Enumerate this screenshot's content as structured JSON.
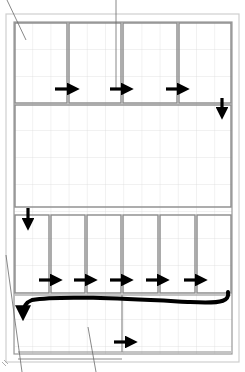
{
  "diagram": {
    "type": "panel-flow-layout",
    "colors": {
      "background": "#ffffff",
      "grid": "#d8d8d8",
      "panel_border": "#8a8a8a",
      "paper_border": "#c8c8c8",
      "arrow": "#000000",
      "annotation_line": "#707070"
    },
    "rows": [
      {
        "id": "top-row",
        "panel_count": 4,
        "arrow_direction": "right",
        "arrow_count": 3
      },
      {
        "id": "middle-wide",
        "panel_count": 1
      },
      {
        "id": "lower-row",
        "panel_count": 6,
        "arrow_direction": "right",
        "arrow_count": 5
      },
      {
        "id": "bottom-band",
        "panel_count": 2,
        "arrow_direction": "right",
        "arrow_count": 1
      }
    ],
    "connectors": [
      {
        "from": "top-row",
        "to": "middle-wide",
        "direction": "down",
        "side": "right"
      },
      {
        "from": "middle-wide",
        "to": "lower-row",
        "direction": "down",
        "side": "left"
      },
      {
        "from": "lower-row",
        "to": "bottom-band",
        "direction": "curved-return",
        "side": "right-to-left"
      }
    ]
  }
}
